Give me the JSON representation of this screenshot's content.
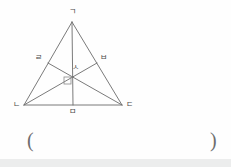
{
  "figure": {
    "stroke_color": "#6b6b6b",
    "label_color": "#4a4a4a",
    "points": {
      "apex": {
        "label": "ㄱ",
        "x": 72,
        "y": 22,
        "label_x": 69,
        "label_y": 8
      },
      "left_vertex": {
        "label": "ㄴ",
        "x": 24,
        "y": 105,
        "label_x": 13,
        "label_y": 103
      },
      "right_vertex": {
        "label": "ㄷ",
        "x": 122,
        "y": 105,
        "label_x": 126,
        "label_y": 103
      },
      "left_midpoint": {
        "label": "ㄹ",
        "x": 48,
        "y": 63,
        "label_x": 36,
        "label_y": 56
      },
      "right_midpoint": {
        "label": "ㅂ",
        "x": 97,
        "y": 63,
        "label_x": 100,
        "label_y": 56
      },
      "base_midpoint": {
        "label": "ㅁ",
        "x": 73,
        "y": 105,
        "label_x": 69,
        "label_y": 110
      },
      "centroid": {
        "label": "ㅅ",
        "x": 73,
        "y": 80,
        "label_x": 72,
        "label_y": 66
      }
    },
    "segments": [
      {
        "name": "side-left",
        "from": "apex",
        "to": "left_vertex"
      },
      {
        "name": "side-right",
        "from": "apex",
        "to": "right_vertex"
      },
      {
        "name": "base",
        "from": "left_vertex",
        "to": "right_vertex"
      },
      {
        "name": "median-from-apex",
        "from": "apex",
        "to": "base_midpoint"
      },
      {
        "name": "median-from-left-vertex",
        "from": "left_vertex",
        "to": "right_midpoint"
      },
      {
        "name": "median-from-right-vertex",
        "from": "right_vertex",
        "to": "left_midpoint"
      }
    ],
    "right_angle_mark": {
      "name": "right-angle-mark",
      "x": 64,
      "y": 77,
      "size": 7
    }
  },
  "answer": {
    "open_paren": "(",
    "close_paren": ")",
    "value": ""
  }
}
